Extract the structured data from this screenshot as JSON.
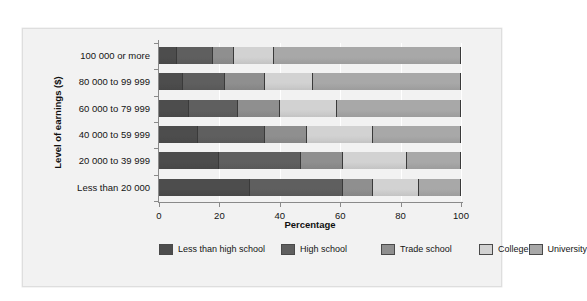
{
  "chart_data": {
    "type": "bar",
    "orientation": "horizontal",
    "stacked": true,
    "percent": true,
    "title": "",
    "xlabel": "Percentage",
    "ylabel": "Level of earnings ($)",
    "xlim": [
      0,
      100
    ],
    "xticks": [
      0,
      20,
      40,
      60,
      80,
      100
    ],
    "grid": true,
    "legend_position": "bottom",
    "categories": [
      "100 000 or more",
      "80 000 to 99 999",
      "60 000 to 79 999",
      "40 000 to 59 999",
      "20 000 to 39 999",
      "Less than 20 000"
    ],
    "series": [
      {
        "name": "Less than high school",
        "color": "#4d4d4d",
        "values": [
          6,
          8,
          10,
          13,
          20,
          30
        ]
      },
      {
        "name": "High school",
        "color": "#5f5f5f",
        "values": [
          12,
          14,
          16,
          22,
          27,
          31
        ]
      },
      {
        "name": "Trade school",
        "color": "#8f8f8f",
        "values": [
          7,
          13,
          14,
          14,
          14,
          10
        ]
      },
      {
        "name": "College",
        "color": "#d2d2d2",
        "values": [
          13,
          16,
          19,
          22,
          21,
          15
        ]
      },
      {
        "name": "University",
        "color": "#a8a8a8",
        "values": [
          62,
          49,
          41,
          29,
          18,
          14
        ]
      }
    ]
  },
  "legend": {
    "items": [
      {
        "label": "Less than high school",
        "color": "#4d4d4d"
      },
      {
        "label": "High school",
        "color": "#5f5f5f"
      },
      {
        "label": "Trade school",
        "color": "#8f8f8f"
      },
      {
        "label": "College",
        "color": "#d2d2d2"
      },
      {
        "label": "University",
        "color": "#a8a8a8"
      }
    ]
  }
}
